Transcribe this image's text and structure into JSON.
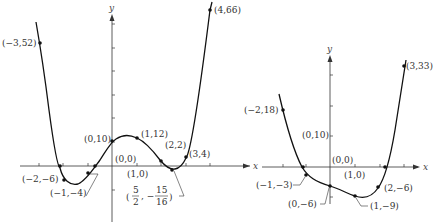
{
  "figure": {
    "left_graph": {
      "axis_labels": {
        "x": "x",
        "y": "y"
      },
      "points": [
        {
          "label": "(−3,52)",
          "x": -3,
          "y": 52
        },
        {
          "label": "(4,66)",
          "x": 4,
          "y": 66
        },
        {
          "label": "(0,10)",
          "x": 0,
          "y": 10
        },
        {
          "label": "(1,12)",
          "x": 1,
          "y": 12
        },
        {
          "label": "(2,2)",
          "x": 2,
          "y": 2
        },
        {
          "label": "(3,4)",
          "x": 3,
          "y": 4
        },
        {
          "label": "(0,0)",
          "x": 0,
          "y": 0
        },
        {
          "label": "(1,0)",
          "x": 1,
          "y": 0
        },
        {
          "label": "(−2,−6)",
          "x": -2,
          "y": -6
        },
        {
          "label": "(−1,−4)",
          "x": -1,
          "y": -4
        }
      ],
      "min_point_label": {
        "num_x": "5",
        "den_x": "2",
        "num_y": "15",
        "den_y": "16",
        "x": 2.5,
        "y": -0.9375
      }
    },
    "right_graph": {
      "axis_labels": {
        "x": "x",
        "y": "y"
      },
      "points": [
        {
          "label": "(−2,18)",
          "x": -2,
          "y": 18
        },
        {
          "label": "(3,33)",
          "x": 3,
          "y": 33
        },
        {
          "label": "(0,10)",
          "x": 0,
          "y": 10
        },
        {
          "label": "(0,0)",
          "x": 0,
          "y": 0
        },
        {
          "label": "(1,0)",
          "x": 1,
          "y": 0
        },
        {
          "label": "(−1,−3)",
          "x": -1,
          "y": -3
        },
        {
          "label": "(0,−6)",
          "x": 0,
          "y": -6
        },
        {
          "label": "(1,−9)",
          "x": 1,
          "y": -9
        },
        {
          "label": "(2,−6)",
          "x": 2,
          "y": -6
        }
      ]
    }
  }
}
